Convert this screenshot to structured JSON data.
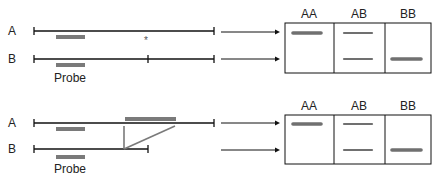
{
  "panels": [
    {
      "name": "snp-panel",
      "chromosomes": [
        {
          "label": "A",
          "y": 31,
          "x1": 34,
          "x2": 214,
          "internal_ticks": []
        },
        {
          "label": "B",
          "y": 59,
          "x1": 34,
          "x2": 214,
          "internal_ticks": [
            148
          ]
        }
      ],
      "probes": [
        {
          "x": 56,
          "y": 35,
          "w": 29,
          "h": 4
        },
        {
          "x": 56,
          "y": 63,
          "w": 29,
          "h": 4
        }
      ],
      "probe_label": "Probe",
      "probe_label_pos": {
        "x": 70,
        "y": 82
      },
      "mutation_marker": {
        "glyph": "*",
        "x": 146,
        "y": 44
      },
      "arrows": [
        {
          "x1": 221,
          "x2": 280,
          "y": 32
        },
        {
          "x1": 221,
          "x2": 280,
          "y": 59
        }
      ],
      "gel": {
        "x": 285,
        "y": 23,
        "w": 146,
        "h": 50,
        "dividers": [
          334,
          385
        ],
        "lanes": [
          {
            "label": "AA",
            "label_x": 309
          },
          {
            "label": "AB",
            "label_x": 359
          },
          {
            "label": "BB",
            "label_x": 408
          }
        ],
        "bands": [
          {
            "lane": "AA",
            "x1": 293,
            "x2": 321,
            "y": 33,
            "weight": "heavy"
          },
          {
            "lane": "AB",
            "x1": 344,
            "x2": 372,
            "y": 33,
            "weight": "light"
          },
          {
            "lane": "AB",
            "x1": 344,
            "x2": 372,
            "y": 59,
            "weight": "light"
          },
          {
            "lane": "BB",
            "x1": 392,
            "x2": 421,
            "y": 59,
            "weight": "heavy"
          }
        ],
        "header_y": 18
      }
    },
    {
      "name": "indel-panel",
      "chromosomes": [
        {
          "label": "A",
          "y": 123,
          "x1": 34,
          "x2": 214,
          "internal_ticks": []
        },
        {
          "label": "B",
          "y": 149,
          "x1": 34,
          "x2": 148,
          "internal_ticks": []
        }
      ],
      "probes": [
        {
          "x": 56,
          "y": 127,
          "w": 29,
          "h": 4
        },
        {
          "x": 56,
          "y": 155,
          "w": 29,
          "h": 4
        }
      ],
      "insertion": {
        "x": 125,
        "y": 117,
        "w": 51,
        "h": 4,
        "apex_x": 124,
        "apex_y": 149,
        "top_y": 126,
        "right_x": 175
      },
      "probe_label": "Probe",
      "probe_label_pos": {
        "x": 70,
        "y": 173
      },
      "arrows": [
        {
          "x1": 221,
          "x2": 280,
          "y": 123
        },
        {
          "x1": 221,
          "x2": 280,
          "y": 150
        }
      ],
      "gel": {
        "x": 285,
        "y": 115,
        "w": 146,
        "h": 49,
        "dividers": [
          334,
          385
        ],
        "lanes": [
          {
            "label": "AA",
            "label_x": 309
          },
          {
            "label": "AB",
            "label_x": 359
          },
          {
            "label": "BB",
            "label_x": 408
          }
        ],
        "bands": [
          {
            "lane": "AA",
            "x1": 293,
            "x2": 321,
            "y": 124,
            "weight": "heavy"
          },
          {
            "lane": "AB",
            "x1": 344,
            "x2": 372,
            "y": 124,
            "weight": "light"
          },
          {
            "lane": "AB",
            "x1": 344,
            "x2": 372,
            "y": 150,
            "weight": "light"
          },
          {
            "lane": "BB",
            "x1": 392,
            "x2": 421,
            "y": 150,
            "weight": "heavy"
          }
        ],
        "header_y": 110
      }
    }
  ],
  "colors": {
    "line": "#111111",
    "probe": "#7a7a7a",
    "band": "#707070",
    "text": "#222222"
  }
}
